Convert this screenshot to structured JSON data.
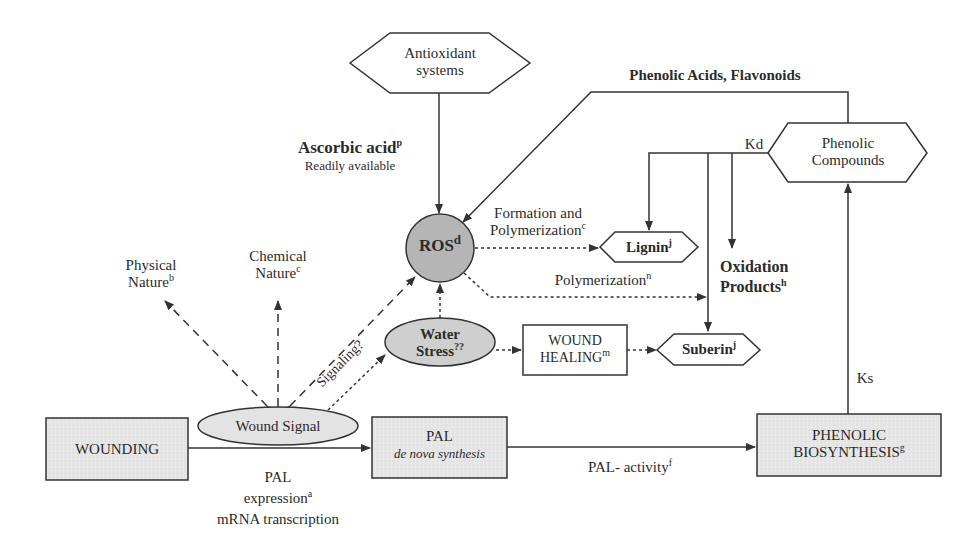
{
  "diagram": {
    "colors": {
      "stroke": "#333333",
      "box_fill": "#e6e6e6",
      "ros_fill": "#b5b5b5",
      "ellipse_fill": "#e3e3e3",
      "water_fill": "#cfcfcf",
      "background": "#ffffff"
    },
    "nodes": {
      "antioxidant": {
        "line1": "Antioxidant",
        "line2": "systems"
      },
      "ascorbic": {
        "title": "Ascorbic acid",
        "sup": "p",
        "subtitle": "Readily available"
      },
      "phenolic_acids_label": "Phenolic Acids, Flavonoids",
      "phenolic_compounds": {
        "line1": "Phenolic",
        "line2": "Compounds"
      },
      "kd_label": "Kd",
      "ks_label": "Ks",
      "ros": {
        "text": "ROS",
        "sup": "d"
      },
      "formation_label": {
        "line1": "Formation and",
        "line2": "Polymerization",
        "sup": "c"
      },
      "lignin": {
        "text": "Lignin",
        "sup": "j"
      },
      "oxidation_products": {
        "line1": "Oxidation",
        "line2": "Products",
        "sup": "h"
      },
      "polymerization_label": {
        "text": "Polymerization",
        "sup": "n"
      },
      "physical_nature": {
        "line1": "Physical",
        "line2": "Nature",
        "sup": "b"
      },
      "chemical_nature": {
        "line1": "Chemical",
        "line2": "Nature",
        "sup": "c"
      },
      "water_stress": {
        "line1": "Water",
        "line2": "Stress",
        "sup": "??"
      },
      "wound_healing": {
        "line1": "WOUND",
        "line2": "HEALING",
        "sup": "m"
      },
      "suberin": {
        "text": "Suberin",
        "sup": "j"
      },
      "signaling_label": "Signaling?",
      "wound_signal": "Wound Signal",
      "wounding": "WOUNDING",
      "pal": {
        "line1": "PAL",
        "line2": "de nova synthesis"
      },
      "pal_expression": {
        "line1": "PAL",
        "line2": "expression",
        "sup": "a",
        "line3": "mRNA transcription"
      },
      "pal_activity": {
        "text": "PAL- activity",
        "sup": "f"
      },
      "phenolic_biosynthesis": {
        "line1": "PHENOLIC",
        "line2": "BIOSYNTHESIS",
        "sup": "g"
      }
    }
  }
}
